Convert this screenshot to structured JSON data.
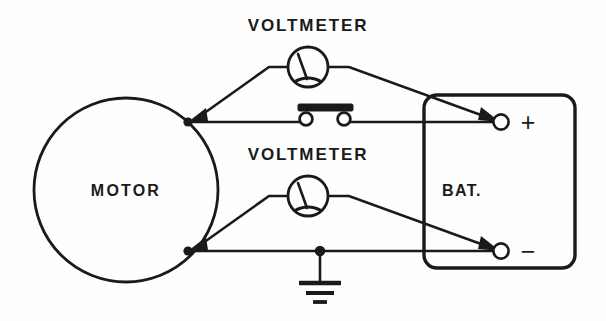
{
  "diagram": {
    "background_color": "#fefefe",
    "ink_color": "#1a1a1a",
    "components": {
      "motor": {
        "label": "MOTOR",
        "shape": "circle",
        "center": [
          126,
          190
        ],
        "radius": 92,
        "terminals": [
          {
            "name": "upper-terminal",
            "at": [
              188,
              122
            ]
          },
          {
            "name": "lower-terminal",
            "at": [
              188,
              251
            ]
          }
        ]
      },
      "battery": {
        "label": "BAT.",
        "shape": "rounded-rectangle",
        "bounds": [
          424,
          95,
          575,
          268
        ],
        "terminals": [
          {
            "name": "positive-terminal",
            "sign": "+",
            "at": [
              501,
              122
            ]
          },
          {
            "name": "negative-terminal",
            "sign": "−",
            "at": [
              501,
              251
            ]
          }
        ]
      },
      "voltmeter_top": {
        "label": "VOLTMETER",
        "symbol": "meter-circle-with-needle",
        "center": [
          308,
          67
        ],
        "radius": 20,
        "label_position": [
          308,
          25
        ]
      },
      "voltmeter_bottom": {
        "label": "VOLTMETER",
        "symbol": "meter-circle-with-needle",
        "center": [
          308,
          196
        ],
        "radius": 20,
        "label_position": [
          308,
          154
        ]
      },
      "switch": {
        "name": "shorting-bar-switch",
        "symbol": "bar-on-two-contacts",
        "center": [
          325,
          119
        ],
        "state": "closed"
      },
      "ground": {
        "name": "ground-symbol",
        "symbol": "three-bar-earth-ground",
        "at": [
          320,
          251
        ]
      }
    },
    "labels": [
      {
        "name": "voltmeter-top-label",
        "text": "VOLTMETER"
      },
      {
        "name": "voltmeter-bottom-label",
        "text": "VOLTMETER"
      },
      {
        "name": "motor-label",
        "text": "MOTOR"
      },
      {
        "name": "battery-label",
        "text": "BAT."
      },
      {
        "name": "positive-sign",
        "text": "+"
      },
      {
        "name": "negative-sign",
        "text": "−"
      }
    ],
    "connections": [
      {
        "from": "motor.upper-terminal",
        "to": "battery.positive-terminal",
        "via": "switch"
      },
      {
        "from": "motor.lower-terminal",
        "to": "battery.negative-terminal",
        "via": "ground"
      },
      {
        "from": "voltmeter_top.left-lead",
        "to": "motor.upper-terminal",
        "arrow": true
      },
      {
        "from": "voltmeter_top.right-lead",
        "to": "battery.positive-terminal",
        "arrow": true
      },
      {
        "from": "voltmeter_bottom.left-lead",
        "to": "motor.lower-terminal",
        "arrow": true
      },
      {
        "from": "voltmeter_bottom.right-lead",
        "to": "battery.negative-terminal",
        "arrow": true
      }
    ]
  }
}
